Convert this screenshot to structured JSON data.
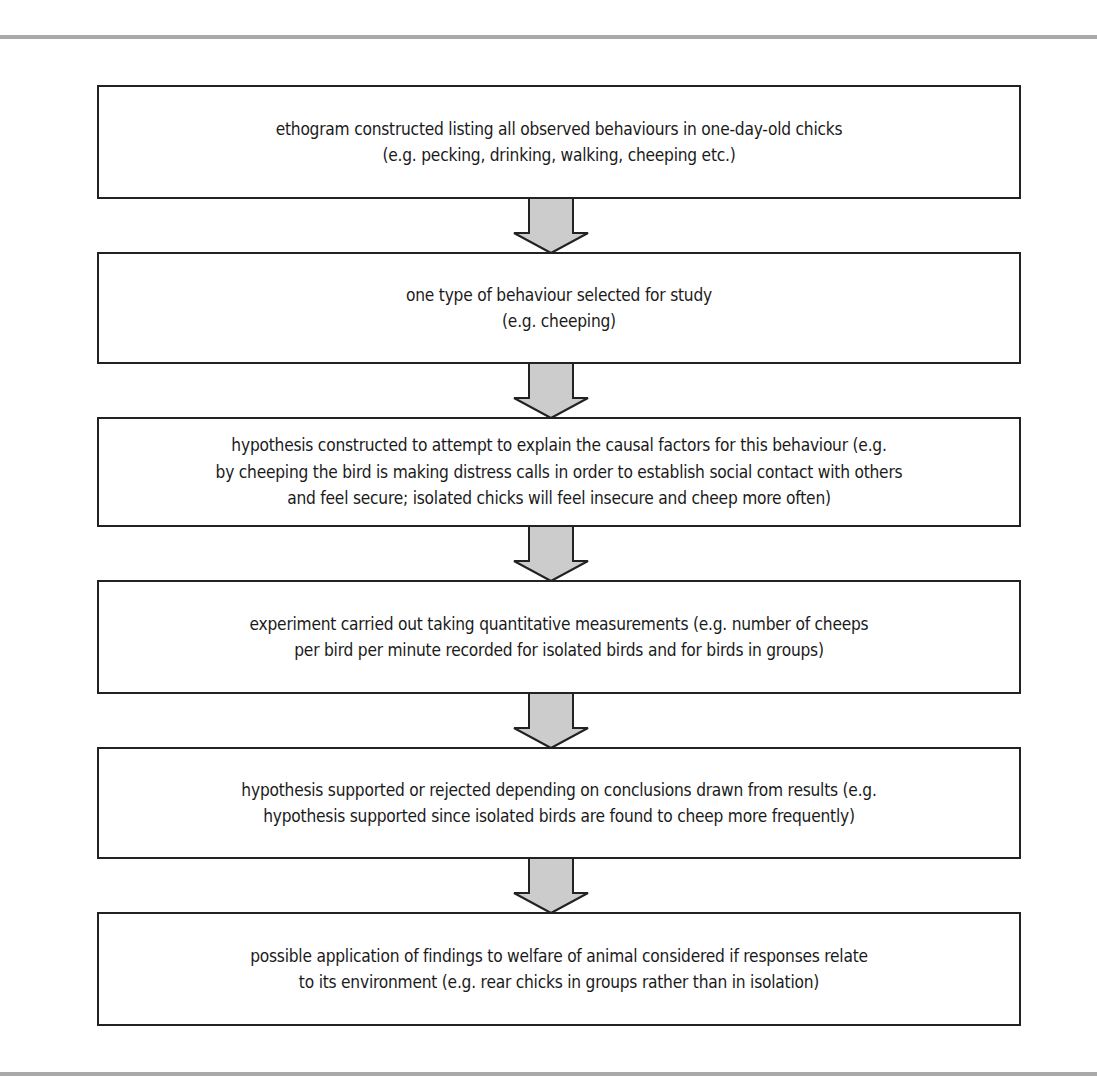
{
  "diagram": {
    "type": "flowchart",
    "direction": "top-to-bottom",
    "colors": {
      "border": "#222222",
      "arrow_fill": "#cccccc",
      "rule": "#a9a9a9",
      "background": "#ffffff"
    },
    "steps": [
      {
        "line1": "ethogram constructed listing all observed behaviours in one-day-old chicks",
        "line2": "(e.g. pecking, drinking, walking, cheeping etc.)"
      },
      {
        "line1": "one type of behaviour selected for study",
        "line2": "(e.g. cheeping)"
      },
      {
        "line1": "hypothesis constructed to attempt to explain the causal factors for this behaviour (e.g.",
        "line2": "by cheeping the bird is making distress calls in order to establish social contact with others",
        "line3": "and feel secure; isolated chicks will feel insecure and cheep more often)"
      },
      {
        "line1": "experiment carried out taking quantitative measurements (e.g. number of cheeps",
        "line2": "per bird per minute recorded for isolated birds and for birds in groups)"
      },
      {
        "line1": "hypothesis supported or rejected depending on conclusions drawn from results (e.g.",
        "line2": "hypothesis supported since isolated birds are found to cheep more frequently)"
      },
      {
        "line1": "possible application of findings to welfare of animal considered if responses relate",
        "line2": "to its environment (e.g. rear chicks in groups rather than in isolation)"
      }
    ],
    "arrows": [
      {
        "from": 0,
        "to": 1,
        "icon": "down-arrow-icon"
      },
      {
        "from": 1,
        "to": 2,
        "icon": "down-arrow-icon"
      },
      {
        "from": 2,
        "to": 3,
        "icon": "down-arrow-icon"
      },
      {
        "from": 3,
        "to": 4,
        "icon": "down-arrow-icon"
      },
      {
        "from": 4,
        "to": 5,
        "icon": "down-arrow-icon"
      }
    ]
  }
}
